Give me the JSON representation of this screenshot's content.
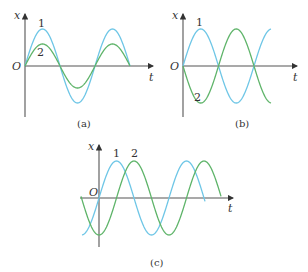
{
  "colors": {
    "curve1": "#6ec6e6",
    "curve2": "#5fb46a",
    "axis": "#555555"
  },
  "panels": [
    {
      "id": "a",
      "caption": "(a)",
      "axis_x_label": "x",
      "axis_t_label": "t",
      "origin_label": "O",
      "origin": [
        25,
        66
      ],
      "y_axis": [
        14,
        117
      ],
      "t_axis_end": 153,
      "caption_pos": [
        85,
        127
      ],
      "labels": [
        {
          "text": "1",
          "x": 41,
          "y": 27
        },
        {
          "text": "2",
          "x": 40,
          "y": 56
        }
      ],
      "curves": [
        {
          "name": "1",
          "color_key": "curve1",
          "amp": 37,
          "period": 70,
          "phase_deg": 0,
          "x_start": 25,
          "x_end": 130
        },
        {
          "name": "2",
          "color_key": "curve2",
          "amp": 22,
          "period": 70,
          "phase_deg": 0,
          "x_start": 25,
          "x_end": 130
        }
      ]
    },
    {
      "id": "b",
      "caption": "(b)",
      "axis_x_label": "x",
      "axis_t_label": "t",
      "origin_label": "O",
      "origin": [
        183,
        66
      ],
      "y_axis": [
        14,
        117
      ],
      "t_axis_end": 297,
      "caption_pos": [
        243,
        127
      ],
      "labels": [
        {
          "text": "1",
          "x": 199,
          "y": 26
        },
        {
          "text": "2",
          "x": 197,
          "y": 101
        }
      ],
      "curves": [
        {
          "name": "1",
          "color_key": "curve1",
          "amp": 37,
          "period": 71,
          "phase_deg": 0,
          "x_start": 183,
          "x_end": 271
        },
        {
          "name": "2",
          "color_key": "curve2",
          "amp": 37,
          "period": 71,
          "phase_deg": 180,
          "x_start": 183,
          "x_end": 271
        }
      ]
    },
    {
      "id": "c",
      "caption": "(c)",
      "axis_x_label": "x",
      "axis_t_label": "t",
      "origin_label": "O",
      "origin": [
        99,
        198
      ],
      "y_axis": [
        145,
        247
      ],
      "t_axis_start": 80,
      "t_axis_end": 233,
      "caption_pos": [
        158,
        265
      ],
      "labels": [
        {
          "text": "1",
          "x": 116,
          "y": 157
        },
        {
          "text": "2",
          "x": 134,
          "y": 157
        }
      ],
      "curves": [
        {
          "name": "1",
          "color_key": "curve1",
          "amp": 37,
          "period": 70,
          "phase_deg": 0,
          "x_start": 82,
          "x_end": 205
        },
        {
          "name": "2",
          "color_key": "curve2",
          "amp": 37,
          "period": 70,
          "phase_deg": -90,
          "x_start": 81,
          "x_end": 221
        }
      ]
    }
  ],
  "chart_data": {
    "type": "line",
    "title": "",
    "panels": [
      {
        "caption": "(a)",
        "xlabel": "t",
        "ylabel": "x",
        "series": [
          {
            "name": "1",
            "amplitude": 1.0,
            "phase": "0",
            "relation": "same phase, larger amplitude"
          },
          {
            "name": "2",
            "amplitude": 0.6,
            "phase": "0",
            "relation": "in phase with 1"
          }
        ],
        "periods_shown": 1.5
      },
      {
        "caption": "(b)",
        "xlabel": "t",
        "ylabel": "x",
        "series": [
          {
            "name": "1",
            "amplitude": 1.0,
            "phase": "0"
          },
          {
            "name": "2",
            "amplitude": 1.0,
            "phase": "π",
            "relation": "opposite phase to 1"
          }
        ],
        "periods_shown": 1.25
      },
      {
        "caption": "(c)",
        "xlabel": "t",
        "ylabel": "x",
        "series": [
          {
            "name": "1",
            "amplitude": 1.0,
            "phase": "0"
          },
          {
            "name": "2",
            "amplitude": 1.0,
            "phase": "-π/2",
            "relation": "2 lags 1 by a quarter period"
          }
        ],
        "periods_shown": 1.75
      }
    ]
  }
}
